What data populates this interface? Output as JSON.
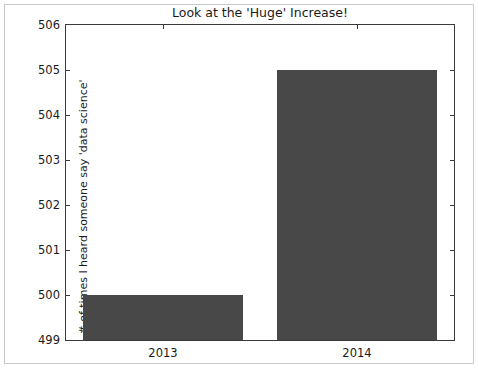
{
  "chart_data": {
    "type": "bar",
    "title": "Look at the 'Huge' Increase!",
    "xlabel": "",
    "ylabel": "# of times I heard someone say 'data science'",
    "categories": [
      "2013",
      "2014"
    ],
    "values": [
      500,
      505
    ],
    "ylim": [
      499,
      506
    ],
    "yticks": [
      499,
      500,
      501,
      502,
      503,
      504,
      505,
      506
    ],
    "ytick_labels": [
      "499",
      "500",
      "501",
      "502",
      "503",
      "504",
      "505",
      "506"
    ],
    "xtick_labels": [
      "2013",
      "2014"
    ],
    "grid": false,
    "legend": false,
    "bar_color": "#484848",
    "axes_color": "#3a3a3a",
    "background": "#ffffff",
    "frame_color": "#c9c9c9",
    "bar_width_fraction": 0.82
  }
}
